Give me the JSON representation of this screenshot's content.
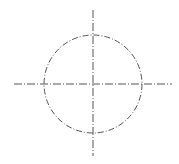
{
  "diagram": {
    "type": "circle-with-centerlines",
    "canvas": {
      "width": 179,
      "height": 164,
      "background": "#ffffff"
    },
    "stroke_color": "#555555",
    "line_style": "dash-dot",
    "circle": {
      "cx": 93,
      "cy": 84,
      "r": 49
    },
    "centerline_horizontal": {
      "x1": 14,
      "y1": 84,
      "x2": 172,
      "y2": 84
    },
    "centerline_vertical": {
      "x1": 93,
      "y1": 10,
      "x2": 93,
      "y2": 156
    }
  }
}
